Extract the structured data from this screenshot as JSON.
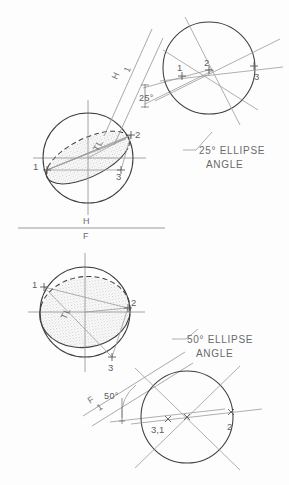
{
  "sheet": {
    "title": "Ellipse angle construction — descriptive geometry plate",
    "background_color": "#fdfdfd",
    "line_color": "#4a4a4a",
    "thin_line_color": "#8e8e8e",
    "label_color": "#5a5a5a",
    "shade_color": "#d6d6d6"
  },
  "fold_line": {
    "upper_label": "H",
    "lower_label": "F",
    "name": "h-f-fold-line"
  },
  "top": {
    "caption_line1": "25° ELLIPSE",
    "caption_line2": "ANGLE",
    "angle_text": "25°",
    "fold_upper_label": "H",
    "fold_lower_label": "1",
    "true_length_label": "TL",
    "left_view": {
      "name": "top-left-circle-view",
      "points": [
        "1",
        "2",
        "3"
      ],
      "center": {
        "x": 88,
        "y": 158
      },
      "radius": 45
    },
    "right_view": {
      "name": "top-right-circle-view",
      "points": [
        "1",
        "2",
        "3"
      ],
      "center": {
        "x": 209,
        "y": 68
      },
      "radius": 46
    }
  },
  "bottom": {
    "caption_line1": "50° ELLIPSE",
    "caption_line2": "ANGLE",
    "angle_text": "50°",
    "fold_upper_label": "F",
    "fold_lower_label": "1",
    "true_length_label": "TL",
    "left_view": {
      "name": "bottom-left-circle-view",
      "points": [
        "1",
        "2",
        "3"
      ],
      "center": {
        "x": 85,
        "y": 312
      },
      "radius": 45
    },
    "right_view": {
      "name": "bottom-right-circle-view",
      "points": [
        "3,1",
        "2"
      ],
      "center": {
        "x": 187,
        "y": 417
      },
      "radius": 46
    }
  }
}
